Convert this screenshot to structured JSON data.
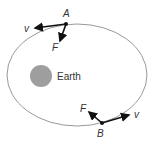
{
  "diagram": {
    "title": "",
    "orbit": {
      "cx": 77,
      "cy": 75,
      "rx": 70,
      "ry": 51,
      "color": "#999999"
    },
    "earth": {
      "label": "Earth",
      "cx": 41,
      "cy": 76,
      "r": 11,
      "color": "#9e9e9e"
    },
    "points": [
      {
        "label": "A",
        "x": 66,
        "y": 24,
        "v": {
          "label": "v",
          "to": [
            34,
            28
          ]
        },
        "F": {
          "label": "F",
          "to": [
            60,
            42
          ]
        }
      },
      {
        "label": "B",
        "x": 102,
        "y": 123,
        "v": {
          "label": "v",
          "to": [
            130,
            114
          ]
        },
        "F": {
          "label": "F",
          "to": [
            88,
            111
          ]
        }
      }
    ]
  }
}
